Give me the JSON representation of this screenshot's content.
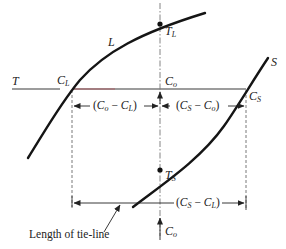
{
  "diagram": {
    "type": "phase-diagram-tie-line",
    "curves": {
      "liquidus": {
        "label": "L"
      },
      "solidus": {
        "label": "S"
      }
    },
    "temperature_label": "T",
    "points": {
      "liquid_comp": {
        "main": "C",
        "sub": "L"
      },
      "overall_comp": {
        "main": "C",
        "sub": "o"
      },
      "solid_comp": {
        "main": "C",
        "sub": "S"
      },
      "liquidus_temp": {
        "main": "T",
        "sub": "L"
      },
      "solidus_temp": {
        "main": "T",
        "sub": "S"
      },
      "overall_comp_bottom": {
        "main": "C",
        "sub": "o"
      }
    },
    "dimensions": {
      "co_minus_cl": {
        "open": "(",
        "a": "C",
        "a_sub": "o",
        "minus": " − ",
        "b": "C",
        "b_sub": "L",
        "close": ")"
      },
      "cs_minus_co": {
        "open": "(",
        "a": "C",
        "a_sub": "S",
        "minus": " − ",
        "b": "C",
        "b_sub": "o",
        "close": ")"
      },
      "cs_minus_cl": {
        "open": "(",
        "a": "C",
        "a_sub": "S",
        "minus": " − ",
        "b": "C",
        "b_sub": "L",
        "close": ")"
      }
    },
    "caption": "Length of tie-line",
    "colors": {
      "curve": "#151515",
      "line": "#3a3a3a",
      "tie_line_accent": "#b0454f",
      "dashed": "#6a6a6a"
    }
  }
}
